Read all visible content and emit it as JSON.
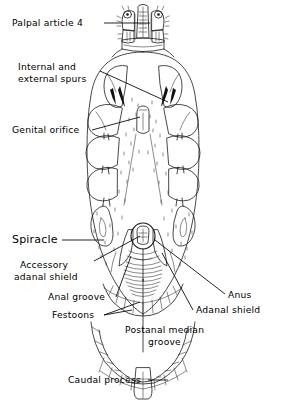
{
  "figure": {
    "background_color": "#ffffff",
    "ink_color": "#1a1a1a"
  },
  "labels": [
    {
      "id": "palpal-article-4",
      "text": "Palpal article 4",
      "side": "left",
      "x": 12,
      "y": 26
    },
    {
      "id": "internal-external-spurs",
      "text": "Internal and",
      "text2": "external spurs",
      "side": "left",
      "x": 18,
      "y": 70
    },
    {
      "id": "genital-orifice",
      "text": "Genital orifice",
      "side": "left",
      "x": 12,
      "y": 133
    },
    {
      "id": "spiracle",
      "text": "Spiracle",
      "side": "left",
      "x": 12,
      "y": 243,
      "emphasis_first_letter": true
    },
    {
      "id": "accessory-adanal-shield",
      "text": "Accessory",
      "text2": "adanal shield",
      "side": "left",
      "x": 20,
      "y": 268
    },
    {
      "id": "anal-groove",
      "text": "Anal groove",
      "side": "left",
      "x": 48,
      "y": 300
    },
    {
      "id": "festoons",
      "text": "Festoons",
      "side": "left",
      "x": 52,
      "y": 318
    },
    {
      "id": "anus",
      "text": "Anus",
      "side": "right",
      "x": 228,
      "y": 298
    },
    {
      "id": "adanal-shield",
      "text": "Adanal shield",
      "side": "right",
      "x": 196,
      "y": 313
    },
    {
      "id": "postanal-median-groove",
      "text": "Postanal median",
      "text2": "groove",
      "side": "center",
      "x": 125,
      "y": 333
    },
    {
      "id": "caudal-process",
      "text": "Caudal process",
      "side": "left",
      "x": 68,
      "y": 383
    }
  ],
  "anatomy_parts": [
    "capitulum",
    "palps",
    "hypostome",
    "basis capituli",
    "coxa I",
    "coxa II",
    "coxa III",
    "coxa IV",
    "internal spur",
    "external spur",
    "genital orifice",
    "spiracular plate",
    "anus",
    "adanal shield",
    "accessory adanal shield",
    "anal groove",
    "postanal median groove",
    "festoons",
    "caudal process"
  ]
}
